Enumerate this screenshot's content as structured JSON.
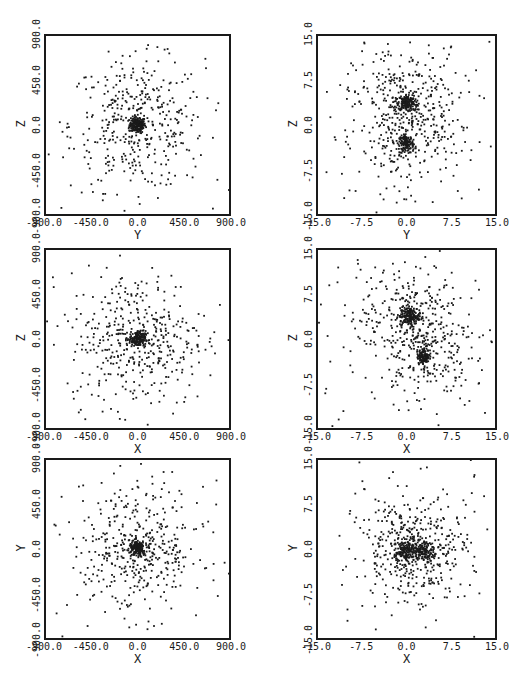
{
  "chart_data": [
    {
      "type": "scatter",
      "panel": "top-left",
      "xlabel": "Y",
      "ylabel": "Z",
      "xlim": [
        -900,
        900
      ],
      "ylim": [
        -900,
        900
      ],
      "xticks": [
        "-900.0",
        "-450.0",
        "0.0",
        "450.0",
        "900.0"
      ],
      "yticks": [
        "-900.0",
        "-450.0",
        "0.0",
        "450.0",
        "900.0"
      ],
      "clusters": [
        {
          "cx": 0,
          "cy": 0,
          "core_sigma": 40,
          "core_n": 180,
          "halo_sigma": 330,
          "halo_n": 420
        }
      ]
    },
    {
      "type": "scatter",
      "panel": "top-right",
      "xlabel": "Y",
      "ylabel": "Z",
      "xlim": [
        -15,
        15
      ],
      "ylim": [
        -15,
        15
      ],
      "xticks": [
        "-15.0",
        "-7.5",
        "0.0",
        "7.5",
        "15.0"
      ],
      "yticks": [
        "-15.0",
        "-7.5",
        "0.0",
        "7.5",
        "15.0"
      ],
      "clusters": [
        {
          "cx": 0,
          "cy": 3.8,
          "core_sigma": 0.7,
          "core_n": 160,
          "halo_sigma": 4.5,
          "halo_n": 260
        },
        {
          "cx": 0,
          "cy": -3,
          "core_sigma": 0.6,
          "core_n": 110,
          "halo_sigma": 4,
          "halo_n": 160
        },
        {
          "cx": 0,
          "cy": 0,
          "core_sigma": 0,
          "core_n": 0,
          "halo_sigma": 9,
          "halo_n": 120
        }
      ]
    },
    {
      "type": "scatter",
      "panel": "middle-left",
      "xlabel": "X",
      "ylabel": "Z",
      "xlim": [
        -900,
        900
      ],
      "ylim": [
        -900,
        900
      ],
      "xticks": [
        "-900.0",
        "-450.0",
        "0.0",
        "450.0",
        "900.0"
      ],
      "yticks": [
        "-900.0",
        "-450.0",
        "0.0",
        "450.0",
        "900.0"
      ],
      "clusters": [
        {
          "cx": 0,
          "cy": 0,
          "core_sigma": 40,
          "core_n": 170,
          "halo_sigma": 340,
          "halo_n": 430
        }
      ]
    },
    {
      "type": "scatter",
      "panel": "middle-right",
      "xlabel": "X",
      "ylabel": "Z",
      "xlim": [
        -15,
        15
      ],
      "ylim": [
        -15,
        15
      ],
      "xticks": [
        "-15.0",
        "-7.5",
        "0.0",
        "7.5",
        "15.0"
      ],
      "yticks": [
        "-15.0",
        "-7.5",
        "0.0",
        "7.5",
        "15.0"
      ],
      "clusters": [
        {
          "cx": 0.5,
          "cy": 3.8,
          "core_sigma": 0.8,
          "core_n": 160,
          "halo_sigma": 4.2,
          "halo_n": 240
        },
        {
          "cx": 3,
          "cy": -3,
          "core_sigma": 0.6,
          "core_n": 110,
          "halo_sigma": 3.8,
          "halo_n": 160
        },
        {
          "cx": 0,
          "cy": 0,
          "core_sigma": 0,
          "core_n": 0,
          "halo_sigma": 9,
          "halo_n": 130
        }
      ]
    },
    {
      "type": "scatter",
      "panel": "bottom-left",
      "xlabel": "X",
      "ylabel": "Y",
      "xlim": [
        -900,
        900
      ],
      "ylim": [
        -900,
        900
      ],
      "xticks": [
        "-900.0",
        "-450.0",
        "0.0",
        "450.0",
        "900.0"
      ],
      "yticks": [
        "-900.0",
        "-450.0",
        "0.0",
        "450.0",
        "900.0"
      ],
      "clusters": [
        {
          "cx": 0,
          "cy": 0,
          "core_sigma": 40,
          "core_n": 170,
          "halo_sigma": 330,
          "halo_n": 430
        }
      ]
    },
    {
      "type": "scatter",
      "panel": "bottom-right",
      "xlabel": "X",
      "ylabel": "Y",
      "xlim": [
        -15,
        15
      ],
      "ylim": [
        -15,
        15
      ],
      "xticks": [
        "-15.0",
        "-7.5",
        "0.0",
        "7.5",
        "15.0"
      ],
      "yticks": [
        "-15.0",
        "-7.5",
        "0.0",
        "7.5",
        "15.0"
      ],
      "clusters": [
        {
          "cx": 0,
          "cy": -0.3,
          "core_sigma": 0.9,
          "core_n": 150,
          "halo_sigma": 4,
          "halo_n": 220
        },
        {
          "cx": 3,
          "cy": -0.3,
          "core_sigma": 0.8,
          "core_n": 110,
          "halo_sigma": 3.6,
          "halo_n": 160
        },
        {
          "cx": 0,
          "cy": 0,
          "core_sigma": 0,
          "core_n": 0,
          "halo_sigma": 9,
          "halo_n": 130
        }
      ]
    }
  ],
  "panels_layout": [
    {
      "left": 44,
      "top": 34,
      "w": 187,
      "h": 182
    },
    {
      "left": 316,
      "top": 34,
      "w": 181,
      "h": 182
    },
    {
      "left": 44,
      "top": 248,
      "w": 187,
      "h": 182
    },
    {
      "left": 316,
      "top": 248,
      "w": 181,
      "h": 182
    },
    {
      "left": 44,
      "top": 458,
      "w": 187,
      "h": 182
    },
    {
      "left": 316,
      "top": 458,
      "w": 181,
      "h": 182
    }
  ],
  "point_color": "#1a1a1a"
}
